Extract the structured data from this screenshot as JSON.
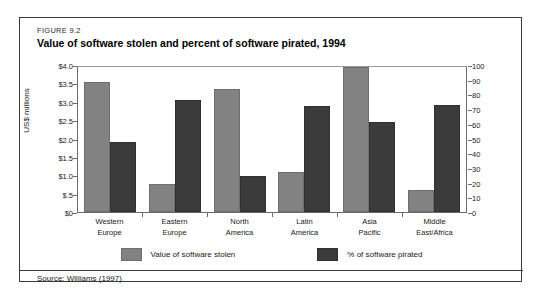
{
  "figure": {
    "number": "FIGURE 9.2",
    "title": "Value of software stolen and percent of software pirated, 1994",
    "source": "Source: Williams (1997)"
  },
  "colors": {
    "value_bar": "#828282",
    "percent_bar": "#3b3b3b",
    "frame": "#3a3a3a"
  },
  "chart_data": {
    "type": "bar",
    "title": "Value of software stolen and percent of software pirated, 1994",
    "categories": [
      "Western\nEurope",
      "Eastern\nEurope",
      "North\nAmerica",
      "Latin\nAmerica",
      "Asia\nPacific",
      "Middle\nEast/Africa"
    ],
    "category_lines": [
      [
        "Western",
        "Europe"
      ],
      [
        "Eastern",
        "Europe"
      ],
      [
        "North",
        "America"
      ],
      [
        "Latin",
        "America"
      ],
      [
        "Asia",
        "Pacific"
      ],
      [
        "Middle",
        "East/Africa"
      ]
    ],
    "series": [
      {
        "name": "Value of software stolen",
        "axis": "left",
        "unit": "US$ millions",
        "values": [
          3.6,
          0.78,
          3.4,
          1.1,
          4.0,
          0.6
        ]
      },
      {
        "name": "% of software pirated",
        "axis": "right",
        "unit": "%",
        "values": [
          48,
          77,
          25,
          73,
          62,
          74
        ]
      }
    ],
    "xlabel": "",
    "ylabel": "US$ millions",
    "ylabel_right": "",
    "ylim": [
      0,
      4.0
    ],
    "ylim_right": [
      0,
      100
    ],
    "yticks": [
      0,
      0.5,
      1.0,
      1.5,
      2.0,
      2.5,
      3.0,
      3.5,
      4.0
    ],
    "ytick_labels": [
      "$0",
      "$.5",
      "$1.0",
      "$1.5",
      "$2.0",
      "$2.5",
      "$3.0",
      "$3.5",
      "$4.0"
    ],
    "yticks_right": [
      0,
      10,
      20,
      30,
      40,
      50,
      60,
      70,
      80,
      90,
      100
    ],
    "ytick_labels_right": [
      "0",
      "10",
      "20",
      "30",
      "40",
      "50",
      "60",
      "70",
      "80",
      "90",
      "100"
    ],
    "grid": false,
    "legend_position": "bottom",
    "legend": [
      "Value of software stolen",
      "% of software pirated"
    ]
  }
}
